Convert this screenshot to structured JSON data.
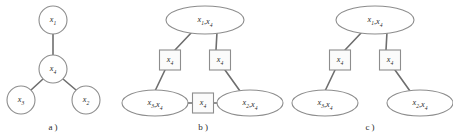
{
  "figure": {
    "width": 453,
    "height": 140,
    "background": "#ffffff",
    "stroke_color": "#8d8d8d",
    "edge_color": "#6e6e6e",
    "text_color": "#2b2b2b"
  },
  "panels": [
    {
      "id": "a",
      "caption": "a )",
      "caption_x": 53,
      "caption_y": 128,
      "type": "undirected-graph",
      "nodes": [
        {
          "name": "node-x1",
          "label_var": "x",
          "label_sub": "1",
          "shape": "circle",
          "cx": 53,
          "cy": 20,
          "rx": 14,
          "ry": 14
        },
        {
          "name": "node-x4",
          "label_var": "x",
          "label_sub": "4",
          "shape": "circle",
          "cx": 53,
          "cy": 69,
          "rx": 14,
          "ry": 14
        },
        {
          "name": "node-x3",
          "label_var": "x",
          "label_sub": "3",
          "shape": "circle",
          "cx": 21,
          "cy": 100,
          "rx": 14,
          "ry": 14
        },
        {
          "name": "node-x2",
          "label_var": "x",
          "label_sub": "2",
          "shape": "circle",
          "cx": 86,
          "cy": 100,
          "rx": 14,
          "ry": 14
        }
      ],
      "edges": [
        {
          "name": "edge-x1-x4",
          "x1": 53,
          "y1": 34,
          "x2": 53,
          "y2": 55
        },
        {
          "name": "edge-x4-x3",
          "x1": 43,
          "y1": 79,
          "x2": 31,
          "y2": 90
        },
        {
          "name": "edge-x4-x2",
          "x1": 63,
          "y1": 79,
          "x2": 76,
          "y2": 90
        }
      ]
    },
    {
      "id": "b",
      "caption": "b )",
      "caption_x": 203,
      "caption_y": 128,
      "type": "junction-graph",
      "nodes": [
        {
          "name": "cluster-x1-x4",
          "shape": "ellipse",
          "cx": 205,
          "cy": 20,
          "rx": 39,
          "ry": 14,
          "parts": [
            {
              "var": "x",
              "sub": "1"
            },
            {
              "var": "x",
              "sub": "4"
            }
          ]
        },
        {
          "name": "cluster-x3-x4",
          "shape": "ellipse",
          "cx": 155,
          "cy": 103,
          "rx": 33,
          "ry": 13,
          "parts": [
            {
              "var": "x",
              "sub": "3"
            },
            {
              "var": "x",
              "sub": "4"
            }
          ]
        },
        {
          "name": "cluster-x2-x4",
          "shape": "ellipse",
          "cx": 250,
          "cy": 103,
          "rx": 33,
          "ry": 13,
          "parts": [
            {
              "var": "x",
              "sub": "2"
            },
            {
              "var": "x",
              "sub": "4"
            }
          ]
        }
      ],
      "separators": [
        {
          "name": "separator-left-x4",
          "shape": "rect",
          "cx": 170,
          "cy": 60,
          "w": 21,
          "h": 20,
          "parts": [
            {
              "var": "x",
              "sub": "4"
            }
          ]
        },
        {
          "name": "separator-right-x4",
          "shape": "rect",
          "cx": 220,
          "cy": 60,
          "w": 21,
          "h": 20,
          "parts": [
            {
              "var": "x",
              "sub": "4"
            }
          ]
        },
        {
          "name": "separator-bottom-x4",
          "shape": "rect",
          "cx": 203,
          "cy": 103,
          "w": 21,
          "h": 20,
          "parts": [
            {
              "var": "x",
              "sub": "4"
            }
          ]
        }
      ],
      "edges": [
        {
          "name": "edge-top-to-left-sep",
          "x1": 192,
          "y1": 32,
          "x2": 175,
          "y2": 50
        },
        {
          "name": "edge-top-to-right-sep",
          "x1": 217,
          "y1": 32,
          "x2": 216,
          "y2": 50
        },
        {
          "name": "edge-left-sep-to-x3x4",
          "x1": 165,
          "y1": 70,
          "x2": 155,
          "y2": 91
        },
        {
          "name": "edge-right-sep-to-x2x4",
          "x1": 225,
          "y1": 70,
          "x2": 240,
          "y2": 91
        },
        {
          "name": "edge-x3x4-to-bottom-sep",
          "x1": 188,
          "y1": 103,
          "x2": 193,
          "y2": 103
        },
        {
          "name": "edge-bottom-sep-to-x2x4",
          "x1": 214,
          "y1": 103,
          "x2": 218,
          "y2": 103
        }
      ]
    },
    {
      "id": "c",
      "caption": "c )",
      "caption_x": 370,
      "caption_y": 128,
      "type": "junction-tree",
      "nodes": [
        {
          "name": "cluster-x1-x4",
          "shape": "ellipse",
          "cx": 375,
          "cy": 20,
          "rx": 39,
          "ry": 14,
          "parts": [
            {
              "var": "x",
              "sub": "1"
            },
            {
              "var": "x",
              "sub": "4"
            }
          ]
        },
        {
          "name": "cluster-x3-x4",
          "shape": "ellipse",
          "cx": 325,
          "cy": 103,
          "rx": 33,
          "ry": 13,
          "parts": [
            {
              "var": "x",
              "sub": "3"
            },
            {
              "var": "x",
              "sub": "4"
            }
          ]
        },
        {
          "name": "cluster-x2-x4",
          "shape": "ellipse",
          "cx": 420,
          "cy": 103,
          "rx": 33,
          "ry": 13,
          "parts": [
            {
              "var": "x",
              "sub": "2"
            },
            {
              "var": "x",
              "sub": "4"
            }
          ]
        }
      ],
      "separators": [
        {
          "name": "separator-left-x4",
          "shape": "rect",
          "cx": 340,
          "cy": 60,
          "w": 21,
          "h": 20,
          "parts": [
            {
              "var": "x",
              "sub": "4"
            }
          ]
        },
        {
          "name": "separator-right-x4",
          "shape": "rect",
          "cx": 390,
          "cy": 60,
          "w": 21,
          "h": 20,
          "parts": [
            {
              "var": "x",
              "sub": "4"
            }
          ]
        }
      ],
      "edges": [
        {
          "name": "edge-top-to-left-sep",
          "x1": 362,
          "y1": 32,
          "x2": 345,
          "y2": 50
        },
        {
          "name": "edge-top-to-right-sep",
          "x1": 387,
          "y1": 32,
          "x2": 386,
          "y2": 50
        },
        {
          "name": "edge-left-sep-to-x3x4",
          "x1": 335,
          "y1": 70,
          "x2": 325,
          "y2": 91
        },
        {
          "name": "edge-right-sep-to-x2x4",
          "x1": 395,
          "y1": 70,
          "x2": 410,
          "y2": 91
        }
      ]
    }
  ]
}
